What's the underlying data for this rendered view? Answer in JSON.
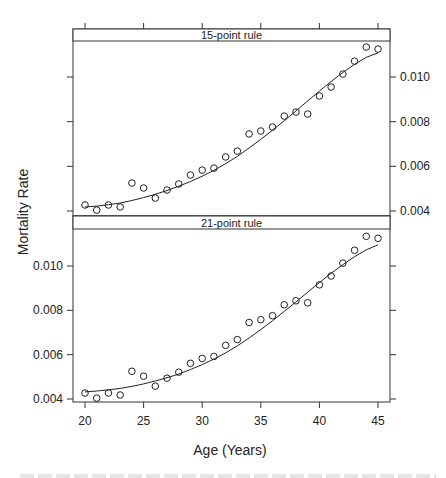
{
  "chart_data": {
    "type": "scatter",
    "title": "",
    "xlabel": "Age (Years)",
    "ylabel": "Mortality Rate",
    "xlim": [
      19.3,
      46
    ],
    "ylim": [
      0.0038,
      0.0118
    ],
    "x_ticks": [
      20,
      25,
      30,
      35,
      40,
      45
    ],
    "y_ticks": [
      0.004,
      0.006,
      0.008,
      0.01
    ],
    "y_tick_labels": [
      "0.004",
      "0.006",
      "0.008",
      "0.010"
    ],
    "grid": false,
    "layout": "two stacked panels (trellis), shared x axis",
    "x": [
      20,
      21,
      22,
      23,
      24,
      25,
      26,
      27,
      28,
      29,
      30,
      31,
      32,
      33,
      34,
      35,
      36,
      37,
      38,
      39,
      40,
      41,
      42,
      43,
      44,
      45
    ],
    "observed": [
      0.00427,
      0.00404,
      0.00427,
      0.00418,
      0.00525,
      0.00503,
      0.00458,
      0.00494,
      0.00521,
      0.00561,
      0.00583,
      0.00592,
      0.00642,
      0.00668,
      0.00745,
      0.00758,
      0.00776,
      0.00825,
      0.00843,
      0.00834,
      0.00915,
      0.00955,
      0.01013,
      0.01071,
      0.01134,
      0.01125
    ],
    "panels": [
      {
        "strip": "15-point rule",
        "y_axis_side": "right",
        "series": [
          {
            "name": "observed",
            "style": "open circles",
            "values": [
              0.00427,
              0.00404,
              0.00427,
              0.00418,
              0.00525,
              0.00503,
              0.00458,
              0.00494,
              0.00521,
              0.00561,
              0.00583,
              0.00592,
              0.00642,
              0.00668,
              0.00745,
              0.00758,
              0.00776,
              0.00825,
              0.00843,
              0.00834,
              0.00915,
              0.00955,
              0.01013,
              0.01071,
              0.01134,
              0.01125
            ]
          },
          {
            "name": "smoothed",
            "style": "line",
            "values": [
              0.00418,
              0.00422,
              0.00428,
              0.00436,
              0.00447,
              0.0046,
              0.00475,
              0.00492,
              0.00511,
              0.00532,
              0.00556,
              0.00582,
              0.00612,
              0.00645,
              0.00682,
              0.00721,
              0.00762,
              0.00804,
              0.00848,
              0.00893,
              0.00937,
              0.0098,
              0.0102,
              0.01057,
              0.01088,
              0.01108
            ]
          }
        ]
      },
      {
        "strip": "21-point rule",
        "y_axis_side": "left",
        "series": [
          {
            "name": "observed",
            "style": "open circles",
            "values": [
              0.00427,
              0.00404,
              0.00427,
              0.00418,
              0.00525,
              0.00503,
              0.00458,
              0.00494,
              0.00521,
              0.00561,
              0.00583,
              0.00592,
              0.00642,
              0.00668,
              0.00745,
              0.00758,
              0.00776,
              0.00825,
              0.00843,
              0.00834,
              0.00915,
              0.00955,
              0.01013,
              0.01071,
              0.01134,
              0.01125
            ]
          },
          {
            "name": "smoothed",
            "style": "line",
            "values": [
              0.00432,
              0.00436,
              0.00441,
              0.00448,
              0.00457,
              0.00468,
              0.00481,
              0.00496,
              0.00513,
              0.00533,
              0.00555,
              0.0058,
              0.00608,
              0.0064,
              0.00675,
              0.00713,
              0.00753,
              0.00795,
              0.00838,
              0.00882,
              0.00925,
              0.00967,
              0.01006,
              0.01042,
              0.01073,
              0.01095
            ]
          }
        ]
      }
    ]
  }
}
